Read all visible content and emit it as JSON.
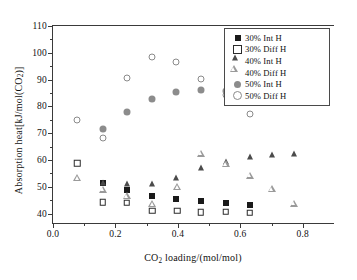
{
  "chart_data": {
    "type": "scatter",
    "title": "",
    "xlabel": "CO2 loading/(mol/mol)",
    "ylabel": "Absorption heat[kJ/mol(CO2)]",
    "xlim": [
      0.0,
      0.9
    ],
    "ylim": [
      36.5,
      110
    ],
    "xticks": [
      0.0,
      0.2,
      0.4,
      0.6,
      0.8
    ],
    "xticklabels": [
      "0.0",
      "0.2",
      "0.4",
      "0.6",
      "0.8"
    ],
    "xminor": [
      0.1,
      0.3,
      0.5,
      0.7
    ],
    "yticks": [
      40,
      50,
      60,
      70,
      80,
      90,
      100,
      110
    ],
    "yticklabels": [
      "40",
      "50",
      "60",
      "70",
      "80",
      "90",
      "100",
      "110"
    ],
    "yminor": [
      45,
      55,
      65,
      75,
      85,
      95,
      105
    ],
    "grid": false,
    "legend_position": "upper right",
    "series": [
      {
        "name": "30% Int H",
        "marker": "filled-square",
        "color": "#1a1a1a",
        "points": [
          {
            "x": 0.16,
            "y": 51.3
          },
          {
            "x": 0.236,
            "y": 48.8
          },
          {
            "x": 0.318,
            "y": 46.5
          },
          {
            "x": 0.393,
            "y": 45.4
          },
          {
            "x": 0.473,
            "y": 44.6
          },
          {
            "x": 0.553,
            "y": 44.1
          },
          {
            "x": 0.63,
            "y": 43.4
          }
        ]
      },
      {
        "name": "30% Diff H",
        "marker": "open-square",
        "color": "#2b2b2b",
        "points": [
          {
            "x": 0.078,
            "y": 58.7
          },
          {
            "x": 0.16,
            "y": 44.3
          },
          {
            "x": 0.236,
            "y": 44.1
          },
          {
            "x": 0.318,
            "y": 41.0
          },
          {
            "x": 0.398,
            "y": 41.1
          },
          {
            "x": 0.473,
            "y": 40.6
          },
          {
            "x": 0.553,
            "y": 40.7
          },
          {
            "x": 0.63,
            "y": 40.4
          }
        ]
      },
      {
        "name": "40% Int H",
        "marker": "filled-triangle",
        "color": "#4b4b4b",
        "points": [
          {
            "x": 0.16,
            "y": 51.5
          },
          {
            "x": 0.236,
            "y": 51.0
          },
          {
            "x": 0.318,
            "y": 51.2
          },
          {
            "x": 0.393,
            "y": 53.2
          },
          {
            "x": 0.473,
            "y": 57.0
          },
          {
            "x": 0.553,
            "y": 59.3
          },
          {
            "x": 0.63,
            "y": 61.0
          },
          {
            "x": 0.7,
            "y": 62.0
          },
          {
            "x": 0.772,
            "y": 62.4
          }
        ]
      },
      {
        "name": "40% Diff H",
        "marker": "open-triangle",
        "color": "#9a9a9a",
        "points": [
          {
            "x": 0.078,
            "y": 53.3
          },
          {
            "x": 0.16,
            "y": 51.6
          },
          {
            "x": 0.236,
            "y": 51.8
          },
          {
            "x": 0.318,
            "y": 51.3
          },
          {
            "x": 0.398,
            "y": 60.2
          },
          {
            "x": 0.473,
            "y": 75.4
          },
          {
            "x": 0.553,
            "y": 74.2
          },
          {
            "x": 0.63,
            "y": 72.4
          },
          {
            "x": 0.7,
            "y": 70.0
          },
          {
            "x": 0.772,
            "y": 67.2
          }
        ]
      },
      {
        "name": "50% Int H",
        "marker": "filled-circle",
        "color": "#8c8c8c",
        "points": [
          {
            "x": 0.16,
            "y": 71.5
          },
          {
            "x": 0.236,
            "y": 77.8
          },
          {
            "x": 0.318,
            "y": 82.8
          },
          {
            "x": 0.393,
            "y": 85.5
          },
          {
            "x": 0.473,
            "y": 86.1
          },
          {
            "x": 0.553,
            "y": 85.9
          },
          {
            "x": 0.63,
            "y": 84.9
          }
        ]
      },
      {
        "name": "50% Diff H",
        "marker": "open-circle",
        "color": "#8a8a8a",
        "points": [
          {
            "x": 0.078,
            "y": 75.1
          },
          {
            "x": 0.16,
            "y": 68.2
          },
          {
            "x": 0.236,
            "y": 90.7
          },
          {
            "x": 0.318,
            "y": 98.3
          },
          {
            "x": 0.393,
            "y": 96.5
          },
          {
            "x": 0.473,
            "y": 90.4
          },
          {
            "x": 0.553,
            "y": 84.1
          },
          {
            "x": 0.63,
            "y": 77.1
          }
        ]
      }
    ]
  },
  "legend": {
    "items": [
      {
        "label": "30% Int H",
        "marker": "filled-square"
      },
      {
        "label": "30% Diff H",
        "marker": "open-square"
      },
      {
        "label": "40% Int H",
        "marker": "filled-triangle"
      },
      {
        "label": "40% Diff H",
        "marker": "open-triangle"
      },
      {
        "label": "50% Int H",
        "marker": "filled-circle"
      },
      {
        "label": "50% Diff H",
        "marker": "open-circle"
      }
    ]
  }
}
